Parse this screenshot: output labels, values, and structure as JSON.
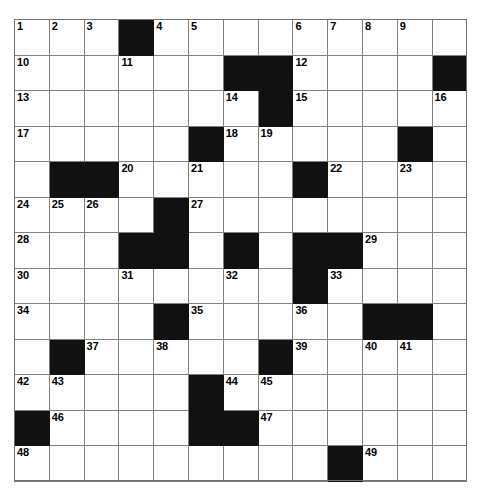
{
  "puzzle": {
    "type": "crossword-grid",
    "rows": 13,
    "columns": 13,
    "cell_colors": {
      "white": "#ffffff",
      "block": "#111111",
      "grid_line": "#808080",
      "number_text": "#000000"
    },
    "max_clue_number": 49,
    "grid": [
      [
        {
          "state": "white",
          "number": "1"
        },
        {
          "state": "white",
          "number": "2"
        },
        {
          "state": "white",
          "number": "3"
        },
        {
          "state": "block",
          "number": ""
        },
        {
          "state": "white",
          "number": "4"
        },
        {
          "state": "white",
          "number": "5"
        },
        {
          "state": "white",
          "number": ""
        },
        {
          "state": "white",
          "number": ""
        },
        {
          "state": "white",
          "number": "6"
        },
        {
          "state": "white",
          "number": "7"
        },
        {
          "state": "white",
          "number": "8"
        },
        {
          "state": "white",
          "number": "9"
        },
        {
          "state": "white",
          "number": ""
        }
      ],
      [
        {
          "state": "white",
          "number": "10"
        },
        {
          "state": "white",
          "number": ""
        },
        {
          "state": "white",
          "number": ""
        },
        {
          "state": "white",
          "number": "11"
        },
        {
          "state": "white",
          "number": ""
        },
        {
          "state": "white",
          "number": ""
        },
        {
          "state": "block",
          "number": ""
        },
        {
          "state": "block",
          "number": ""
        },
        {
          "state": "white",
          "number": "12"
        },
        {
          "state": "white",
          "number": ""
        },
        {
          "state": "white",
          "number": ""
        },
        {
          "state": "white",
          "number": ""
        },
        {
          "state": "block",
          "number": ""
        }
      ],
      [
        {
          "state": "white",
          "number": "13"
        },
        {
          "state": "white",
          "number": ""
        },
        {
          "state": "white",
          "number": ""
        },
        {
          "state": "white",
          "number": ""
        },
        {
          "state": "white",
          "number": ""
        },
        {
          "state": "white",
          "number": ""
        },
        {
          "state": "white",
          "number": "14"
        },
        {
          "state": "block",
          "number": ""
        },
        {
          "state": "white",
          "number": "15"
        },
        {
          "state": "white",
          "number": ""
        },
        {
          "state": "white",
          "number": ""
        },
        {
          "state": "white",
          "number": ""
        },
        {
          "state": "white",
          "number": "16"
        }
      ],
      [
        {
          "state": "white",
          "number": "17"
        },
        {
          "state": "white",
          "number": ""
        },
        {
          "state": "white",
          "number": ""
        },
        {
          "state": "white",
          "number": ""
        },
        {
          "state": "white",
          "number": ""
        },
        {
          "state": "block",
          "number": ""
        },
        {
          "state": "white",
          "number": "18"
        },
        {
          "state": "white",
          "number": "19"
        },
        {
          "state": "white",
          "number": ""
        },
        {
          "state": "white",
          "number": ""
        },
        {
          "state": "white",
          "number": ""
        },
        {
          "state": "block",
          "number": ""
        },
        {
          "state": "white",
          "number": ""
        }
      ],
      [
        {
          "state": "white",
          "number": ""
        },
        {
          "state": "block",
          "number": ""
        },
        {
          "state": "block",
          "number": ""
        },
        {
          "state": "white",
          "number": "20"
        },
        {
          "state": "white",
          "number": ""
        },
        {
          "state": "white",
          "number": "21"
        },
        {
          "state": "white",
          "number": ""
        },
        {
          "state": "white",
          "number": ""
        },
        {
          "state": "block",
          "number": ""
        },
        {
          "state": "white",
          "number": "22"
        },
        {
          "state": "white",
          "number": ""
        },
        {
          "state": "white",
          "number": "23"
        },
        {
          "state": "white",
          "number": ""
        }
      ],
      [
        {
          "state": "white",
          "number": "24"
        },
        {
          "state": "white",
          "number": "25"
        },
        {
          "state": "white",
          "number": "26"
        },
        {
          "state": "white",
          "number": ""
        },
        {
          "state": "block",
          "number": ""
        },
        {
          "state": "white",
          "number": "27"
        },
        {
          "state": "white",
          "number": ""
        },
        {
          "state": "white",
          "number": ""
        },
        {
          "state": "white",
          "number": ""
        },
        {
          "state": "white",
          "number": ""
        },
        {
          "state": "white",
          "number": ""
        },
        {
          "state": "white",
          "number": ""
        },
        {
          "state": "white",
          "number": ""
        }
      ],
      [
        {
          "state": "white",
          "number": "28"
        },
        {
          "state": "white",
          "number": ""
        },
        {
          "state": "white",
          "number": ""
        },
        {
          "state": "block",
          "number": ""
        },
        {
          "state": "block",
          "number": ""
        },
        {
          "state": "white",
          "number": ""
        },
        {
          "state": "block",
          "number": ""
        },
        {
          "state": "white",
          "number": ""
        },
        {
          "state": "block",
          "number": ""
        },
        {
          "state": "block",
          "number": ""
        },
        {
          "state": "white",
          "number": "29"
        },
        {
          "state": "white",
          "number": ""
        },
        {
          "state": "white",
          "number": ""
        }
      ],
      [
        {
          "state": "white",
          "number": "30"
        },
        {
          "state": "white",
          "number": ""
        },
        {
          "state": "white",
          "number": ""
        },
        {
          "state": "white",
          "number": "31"
        },
        {
          "state": "white",
          "number": ""
        },
        {
          "state": "white",
          "number": ""
        },
        {
          "state": "white",
          "number": "32"
        },
        {
          "state": "white",
          "number": ""
        },
        {
          "state": "block",
          "number": ""
        },
        {
          "state": "white",
          "number": "33"
        },
        {
          "state": "white",
          "number": ""
        },
        {
          "state": "white",
          "number": ""
        },
        {
          "state": "white",
          "number": ""
        }
      ],
      [
        {
          "state": "white",
          "number": "34"
        },
        {
          "state": "white",
          "number": ""
        },
        {
          "state": "white",
          "number": ""
        },
        {
          "state": "white",
          "number": ""
        },
        {
          "state": "block",
          "number": ""
        },
        {
          "state": "white",
          "number": "35"
        },
        {
          "state": "white",
          "number": ""
        },
        {
          "state": "white",
          "number": ""
        },
        {
          "state": "white",
          "number": "36"
        },
        {
          "state": "white",
          "number": ""
        },
        {
          "state": "block",
          "number": ""
        },
        {
          "state": "block",
          "number": ""
        },
        {
          "state": "white",
          "number": ""
        }
      ],
      [
        {
          "state": "white",
          "number": ""
        },
        {
          "state": "block",
          "number": ""
        },
        {
          "state": "white",
          "number": "37"
        },
        {
          "state": "white",
          "number": ""
        },
        {
          "state": "white",
          "number": "38"
        },
        {
          "state": "white",
          "number": ""
        },
        {
          "state": "white",
          "number": ""
        },
        {
          "state": "block",
          "number": ""
        },
        {
          "state": "white",
          "number": "39"
        },
        {
          "state": "white",
          "number": ""
        },
        {
          "state": "white",
          "number": "40"
        },
        {
          "state": "white",
          "number": "41"
        },
        {
          "state": "white",
          "number": ""
        }
      ],
      [
        {
          "state": "white",
          "number": "42"
        },
        {
          "state": "white",
          "number": "43"
        },
        {
          "state": "white",
          "number": ""
        },
        {
          "state": "white",
          "number": ""
        },
        {
          "state": "white",
          "number": ""
        },
        {
          "state": "block",
          "number": ""
        },
        {
          "state": "white",
          "number": "44"
        },
        {
          "state": "white",
          "number": "45"
        },
        {
          "state": "white",
          "number": ""
        },
        {
          "state": "white",
          "number": ""
        },
        {
          "state": "white",
          "number": ""
        },
        {
          "state": "white",
          "number": ""
        },
        {
          "state": "white",
          "number": ""
        }
      ],
      [
        {
          "state": "block",
          "number": ""
        },
        {
          "state": "white",
          "number": "46"
        },
        {
          "state": "white",
          "number": ""
        },
        {
          "state": "white",
          "number": ""
        },
        {
          "state": "white",
          "number": ""
        },
        {
          "state": "block",
          "number": ""
        },
        {
          "state": "block",
          "number": ""
        },
        {
          "state": "white",
          "number": "47"
        },
        {
          "state": "white",
          "number": ""
        },
        {
          "state": "white",
          "number": ""
        },
        {
          "state": "white",
          "number": ""
        },
        {
          "state": "white",
          "number": ""
        },
        {
          "state": "white",
          "number": ""
        }
      ],
      [
        {
          "state": "white",
          "number": "48"
        },
        {
          "state": "white",
          "number": ""
        },
        {
          "state": "white",
          "number": ""
        },
        {
          "state": "white",
          "number": ""
        },
        {
          "state": "white",
          "number": ""
        },
        {
          "state": "white",
          "number": ""
        },
        {
          "state": "white",
          "number": ""
        },
        {
          "state": "white",
          "number": ""
        },
        {
          "state": "white",
          "number": ""
        },
        {
          "state": "block",
          "number": ""
        },
        {
          "state": "white",
          "number": "49"
        },
        {
          "state": "white",
          "number": ""
        },
        {
          "state": "white",
          "number": ""
        }
      ]
    ]
  }
}
